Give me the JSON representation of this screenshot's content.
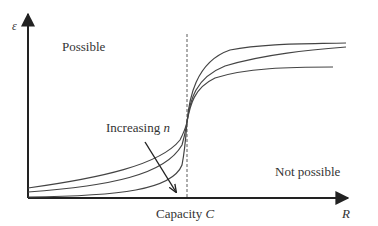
{
  "figure": {
    "type": "diagram",
    "y_axis_label": "ε",
    "x_axis_label": "R",
    "capacity_label_prefix": "Capacity ",
    "capacity_label_symbol": "C",
    "region_left": "Possible",
    "region_right": "Not possible",
    "annotation_prefix": "Increasing ",
    "annotation_symbol": "n",
    "colors": {
      "axes": "#222222",
      "curves": "#444444",
      "text": "#333333",
      "dashed": "#777777"
    }
  },
  "curves": [
    {
      "name": "small n",
      "start": [
        28,
        188
      ],
      "crossing": [
        187,
        122
      ],
      "end": [
        346,
        43
      ]
    },
    {
      "name": "medium n",
      "start": [
        28,
        192
      ],
      "crossing": [
        187,
        122
      ],
      "end": [
        346,
        47
      ]
    },
    {
      "name": "large n",
      "start": [
        28,
        197
      ],
      "crossing": [
        187,
        122
      ],
      "end": [
        333,
        67
      ]
    }
  ]
}
